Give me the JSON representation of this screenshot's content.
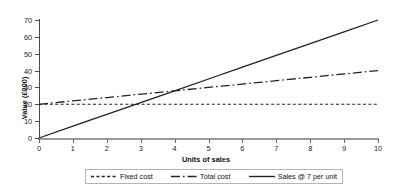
{
  "chart_data": {
    "type": "line",
    "title": "",
    "xlabel": "Units of sales",
    "ylabel": "Value (£000)",
    "xlim": [
      0,
      10
    ],
    "ylim": [
      0,
      70
    ],
    "xticks": [
      0,
      1,
      2,
      3,
      4,
      5,
      6,
      7,
      8,
      9,
      10
    ],
    "yticks": [
      0,
      10,
      20,
      30,
      40,
      50,
      60,
      70
    ],
    "xtick_labels": [
      "0",
      "1",
      "2",
      "3",
      "4",
      "5",
      "6",
      "7",
      "8",
      "9",
      "10"
    ],
    "ytick_labels": [
      "0",
      "10",
      "20",
      "30",
      "40",
      "50",
      "60",
      "70"
    ],
    "grid": false,
    "legend_position": "bottom",
    "x": [
      0,
      1,
      2,
      3,
      4,
      5,
      6,
      7,
      8,
      9,
      10
    ],
    "series": [
      {
        "name": "Fixed cost",
        "style": "dashed",
        "color": "#222222",
        "values": [
          20,
          20,
          20,
          20,
          20,
          20,
          20,
          20,
          20,
          20,
          20
        ]
      },
      {
        "name": "Total cost",
        "style": "dash-dot",
        "color": "#222222",
        "values": [
          20,
          22,
          24,
          26,
          28,
          30,
          32,
          34,
          36,
          38,
          40
        ]
      },
      {
        "name": "Sales @ 7 per unit",
        "style": "solid",
        "color": "#222222",
        "values": [
          0,
          7,
          14,
          21,
          28,
          35,
          42,
          49,
          56,
          63,
          70
        ]
      }
    ],
    "annotations": []
  },
  "legend": {
    "items": [
      {
        "label": "Fixed cost",
        "swatch": "dashed-line-swatch"
      },
      {
        "label": "Total cost",
        "swatch": "dash-dot-line-swatch"
      },
      {
        "label": "Sales @ 7 per unit",
        "swatch": "solid-line-swatch"
      }
    ]
  },
  "colors": {
    "line": "#222222",
    "axis": "#4a4a4a",
    "xaxis": "#9a9a9a",
    "legend_border": "#b4b4b4",
    "background": "#ffffff"
  }
}
